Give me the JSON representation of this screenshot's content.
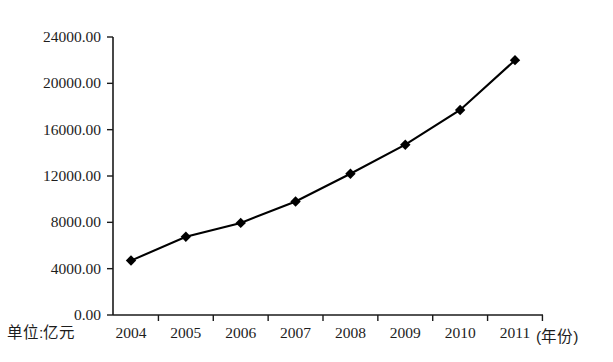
{
  "chart_data": {
    "type": "line",
    "title": "",
    "subtitle": "",
    "xlabel": "(年份)",
    "ylabel": "",
    "unit_note": "单位:亿元",
    "categories": [
      "2004",
      "2005",
      "2006",
      "2007",
      "2008",
      "2009",
      "2010",
      "2011"
    ],
    "x": [
      2004,
      2005,
      2006,
      2007,
      2008,
      2009,
      2010,
      2011
    ],
    "values": [
      4700,
      6750,
      7950,
      9800,
      12200,
      14700,
      17700,
      22000
    ],
    "series": [
      {
        "name": "",
        "values": [
          4700,
          6750,
          7950,
          9800,
          12200,
          14700,
          17700,
          22000
        ],
        "color": "#000000",
        "marker": "diamond"
      }
    ],
    "ylim": [
      0,
      24000
    ],
    "ytick_values": [
      0,
      4000,
      8000,
      12000,
      16000,
      20000,
      24000
    ],
    "ytick_labels": [
      "0.00",
      "4000.00",
      "8000.00",
      "12000.00",
      "16000.00",
      "20000.00",
      "24000.00"
    ],
    "xtick_labels": [
      "2004",
      "2005",
      "2006",
      "2007",
      "2008",
      "2009",
      "2010",
      "2011"
    ],
    "grid": false,
    "legend": false,
    "legend_position": "none"
  },
  "axes": {
    "x_axis_suffix_label": "(年份)",
    "unit_caption": "单位:亿元"
  },
  "style": {
    "line_color": "#000000",
    "marker_color": "#000000",
    "axis_color": "#1a1a1a",
    "background": "#ffffff"
  }
}
